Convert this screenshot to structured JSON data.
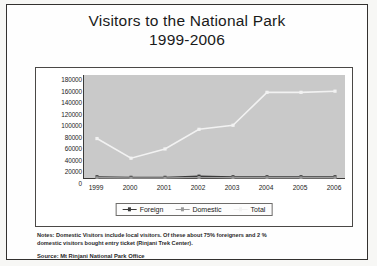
{
  "title": {
    "line1": "Visitors to the National Park",
    "line2": "1999-2006"
  },
  "notes": {
    "line1": "Notes: Domestic Visitors include local visitors. Of these about 75% foreigners and 2 %",
    "line2": "domestic visitors bought entry ticket (Rinjani Trek Center).",
    "source": "Source: Mt Rinjani National Park Office"
  },
  "colors": {
    "plot_background": "#c9c9c9",
    "axis": "#3c3a38",
    "frame": "#33312f",
    "foreign": "#3a3a3a",
    "domestic": "#9a9a9a",
    "total": "#f2f2f2",
    "page_background": "#ffffff"
  },
  "chart_data": {
    "type": "line",
    "title": "Visitors to the National Park 1999-2006",
    "xlabel": "",
    "ylabel": "",
    "categories": [
      "1999",
      "2000",
      "2001",
      "2002",
      "2003",
      "2004",
      "2005",
      "2006"
    ],
    "ylim": [
      0,
      180000
    ],
    "ytick_step": 20000,
    "yticks": [
      "0",
      "20000",
      "40000",
      "60000",
      "80000",
      "100000",
      "120000",
      "140000",
      "160000",
      "180000"
    ],
    "grid": false,
    "legend_position": "bottom",
    "series": [
      {
        "name": "Foreign",
        "color": "#3a3a3a",
        "marker": "square",
        "values": [
          4000,
          3000,
          3000,
          5000,
          4000,
          4000,
          4000,
          4000
        ]
      },
      {
        "name": "Domestic",
        "color": "#9a9a9a",
        "marker": "square",
        "values": [
          2000,
          1500,
          1500,
          2500,
          2000,
          2000,
          2000,
          2000
        ]
      },
      {
        "name": "Total",
        "color": "#f2f2f2",
        "marker": "square",
        "values": [
          70000,
          36000,
          52000,
          86000,
          93000,
          150000,
          150000,
          152000
        ]
      }
    ]
  }
}
